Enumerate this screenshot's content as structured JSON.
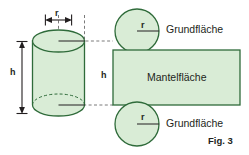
{
  "figure": {
    "caption": "Fig. 3",
    "background_color": "#ffffff",
    "fill_color": "#d9ecd6",
    "stroke_color": "#2f6b3a",
    "text_color": "#231f20",
    "dim_line_color": "#231f20",
    "dashed_line_color": "#6f6f6f"
  },
  "labels": {
    "radius_cylinder": "r",
    "height_cylinder": "h",
    "radius_top_circle": "r",
    "radius_bottom_circle": "r",
    "height_prism": "h",
    "base_face_top": "Grundfläche",
    "lateral_face": "Mantelfläche",
    "base_face_bottom": "Grundfläche"
  },
  "shapes": {
    "cylinder": {
      "name": "cylinder",
      "center_x": 58.5,
      "radius_x": 26,
      "ellipse_ry": 11,
      "top_y": 41,
      "bottom_y": 114
    },
    "top_circle": {
      "name": "top-base-circle",
      "cx": 137,
      "cy": 31,
      "r": 22
    },
    "bottom_circle": {
      "name": "bottom-base-circle",
      "cx": 137,
      "cy": 124,
      "r": 22
    },
    "lateral_rectangle": {
      "name": "lateral-surface-rectangle",
      "x": 113,
      "y": 50,
      "width": 127,
      "height": 55
    }
  },
  "dimensions": {
    "r_arrow_cylinder": {
      "x1": 45,
      "x2": 72,
      "y": 20
    },
    "h_arrow_cylinder": {
      "x": 22,
      "y1": 41,
      "y2": 114
    }
  }
}
